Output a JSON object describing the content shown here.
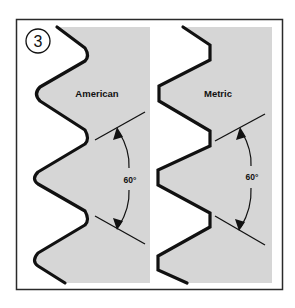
{
  "figure": {
    "number": "3",
    "panels": [
      {
        "id": "american",
        "title": "American",
        "thread_form": "rounded crests and roots",
        "angle_label": "60°"
      },
      {
        "id": "metric",
        "title": "Metric",
        "thread_form": "flat crests and roots",
        "angle_label": "60°"
      }
    ]
  },
  "colors": {
    "frame": "#2a2a2a",
    "thread_fill": "#d6d6d6",
    "profile_stroke": "#111111",
    "background": "#ffffff"
  }
}
